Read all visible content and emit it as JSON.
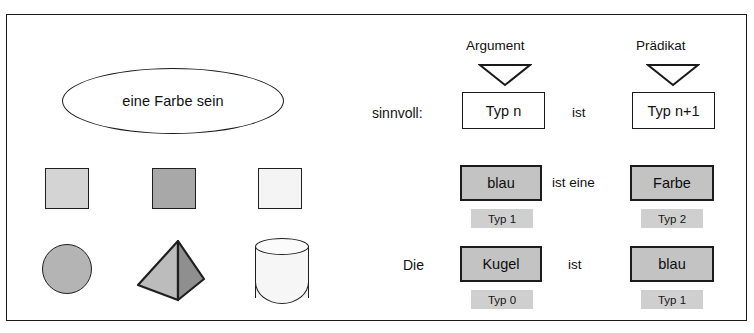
{
  "diagram": {
    "frame_border_color": "#1a1a1a"
  },
  "left_panel": {
    "ellipse": {
      "label": "eine Farbe sein"
    },
    "squares": [
      {
        "name": "square-light",
        "fill": "#d4d4d4"
      },
      {
        "name": "square-medium",
        "fill": "#a8a8a8"
      },
      {
        "name": "square-white",
        "fill": "#f4f4f4"
      }
    ],
    "solids": [
      {
        "name": "sphere",
        "fill": "#b4b4b4"
      },
      {
        "name": "pyramid",
        "fill_left": "#bcbcbc",
        "fill_right": "#8f8f8f"
      },
      {
        "name": "cylinder",
        "fill": "#f6f6f6"
      }
    ]
  },
  "right_panel": {
    "schema_row": {
      "row_label": "sinnvoll:",
      "argument_caption": "Argument",
      "predicate_caption": "Prädikat",
      "argument_box": "Typ n",
      "connector": "ist",
      "predicate_box": "Typ n+1"
    },
    "example_rows": [
      {
        "row_label": "",
        "subject": "blau",
        "subject_type": "Typ 1",
        "connector": "ist eine",
        "object": "Farbe",
        "object_type": "Typ 2"
      },
      {
        "row_label": "Die",
        "subject": "Kugel",
        "subject_type": "Typ 0",
        "connector": "ist",
        "object": "blau",
        "object_type": "Typ 1"
      }
    ]
  },
  "colors": {
    "box_fill": "#c3c3c3",
    "band_fill": "#cfcfcf",
    "outline": "#1a1a1a"
  }
}
